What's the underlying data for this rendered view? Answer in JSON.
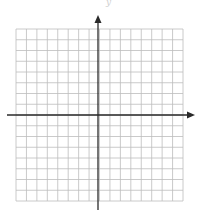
{
  "figure": {
    "type": "coordinate-plane",
    "y_axis_label": "y",
    "grid": {
      "columns": 16,
      "rows": 16,
      "left": 16,
      "top": 29,
      "right": 183,
      "bottom": 201,
      "line_color": "#bdbdbd"
    },
    "axes": {
      "x_axis_y": 115,
      "x_axis_start": 7,
      "x_axis_end": 195,
      "y_axis_x": 98,
      "y_axis_top": 15,
      "y_axis_bottom": 210,
      "color": "#2a2a2a"
    }
  },
  "chart_data": {
    "type": "grid",
    "title": "",
    "xlabel": "",
    "ylabel": "y",
    "xlim": [
      -8,
      8
    ],
    "ylim": [
      -8,
      8
    ],
    "grid": true,
    "x_ticks_labeled": false,
    "y_ticks_labeled": false,
    "series": []
  }
}
